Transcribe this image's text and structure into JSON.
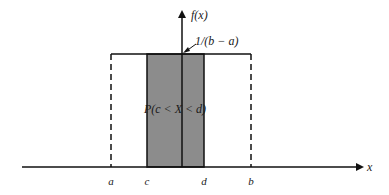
{
  "figure": {
    "type": "uniform-distribution-pdf",
    "y_axis_label": "f(x)",
    "x_axis_label": "x",
    "height_label": "1/(b − a)",
    "region_label": "P(c < X < d)",
    "x_ticks": [
      "a",
      "c",
      "d",
      "b"
    ],
    "colors": {
      "shaded_region": "#8c8c8c",
      "lines": "#111111",
      "background": "#ffffff"
    }
  }
}
